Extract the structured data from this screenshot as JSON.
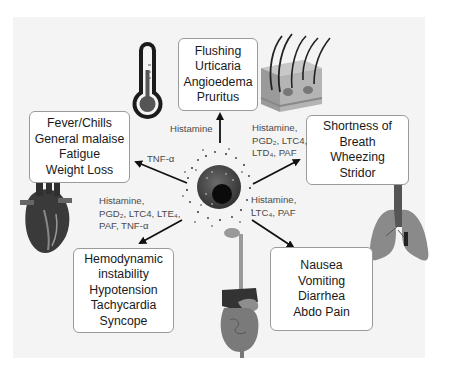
{
  "diagram": {
    "center": {
      "name": "mast cell",
      "color": "#2a2a2a"
    },
    "symptom_boxes": [
      {
        "id": "skin",
        "lines": [
          "Flushing",
          "Urticaria",
          "Angioedema",
          "Pruritus"
        ]
      },
      {
        "id": "constitutional",
        "lines": [
          "Fever/Chills",
          "General malaise",
          "Fatigue",
          "Weight Loss"
        ]
      },
      {
        "id": "respiratory",
        "lines": [
          "Shortness of",
          "Breath",
          "Wheezing",
          "Stridor"
        ]
      },
      {
        "id": "cardiovascular",
        "lines": [
          "Hemodynamic",
          "instability",
          "Hypotension",
          "Tachycardia",
          "Syncope"
        ]
      },
      {
        "id": "gastrointestinal",
        "lines": [
          "Nausea",
          "Vomiting",
          "Diarrhea",
          "Abdo Pain"
        ]
      }
    ],
    "mediator_labels": [
      {
        "id": "skin",
        "lines": [
          "Histamine"
        ]
      },
      {
        "id": "constitutional",
        "lines": [
          "TNF-α"
        ]
      },
      {
        "id": "respiratory",
        "lines": [
          "Histamine,",
          "PGD₂, LTC4,",
          "LTD₄, PAF"
        ]
      },
      {
        "id": "cardiovascular",
        "lines": [
          "Histamine,",
          "PGD₂, LTC4, LTE₄,",
          "PAF, TNF-α"
        ]
      },
      {
        "id": "gastrointestinal",
        "lines": [
          "Histamine,",
          "LTC₄, PAF"
        ]
      }
    ],
    "illustrations": [
      "thermometer-icon",
      "skin-cross-section-icon",
      "lungs-icon",
      "heart-icon",
      "digestive-tract-icon"
    ],
    "colors": {
      "panel": "#f4f4f4",
      "box_border": "#9a9a9a",
      "arrow": "#111111",
      "text": "#1a1a1a",
      "label": "#4a4a4a"
    }
  }
}
